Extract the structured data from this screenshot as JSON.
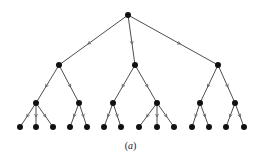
{
  "diagram": {
    "type": "tree",
    "caption": {
      "open": "(",
      "label": "a",
      "close": ")"
    },
    "colors": {
      "edge": "#3a3a3a",
      "node": "#111111",
      "background": "#ffffff"
    },
    "nodes": [
      {
        "id": "r",
        "x": 128,
        "y": 15,
        "level": 0
      },
      {
        "id": "a",
        "x": 59,
        "y": 65,
        "level": 1
      },
      {
        "id": "b",
        "x": 135,
        "y": 65,
        "level": 1
      },
      {
        "id": "c",
        "x": 218,
        "y": 65,
        "level": 1
      },
      {
        "id": "a1",
        "x": 36,
        "y": 103,
        "level": 2
      },
      {
        "id": "a2",
        "x": 79,
        "y": 103,
        "level": 2
      },
      {
        "id": "b1",
        "x": 113,
        "y": 103,
        "level": 2
      },
      {
        "id": "b2",
        "x": 157,
        "y": 103,
        "level": 2
      },
      {
        "id": "c1",
        "x": 200,
        "y": 103,
        "level": 2
      },
      {
        "id": "c2",
        "x": 235,
        "y": 103,
        "level": 2
      },
      {
        "id": "a1x",
        "x": 20,
        "y": 127,
        "level": 3
      },
      {
        "id": "a1y",
        "x": 36,
        "y": 127,
        "level": 3
      },
      {
        "id": "a1z",
        "x": 53,
        "y": 127,
        "level": 3
      },
      {
        "id": "a2x",
        "x": 70,
        "y": 127,
        "level": 3
      },
      {
        "id": "a2y",
        "x": 87,
        "y": 127,
        "level": 3
      },
      {
        "id": "b1x",
        "x": 104,
        "y": 127,
        "level": 3
      },
      {
        "id": "b1y",
        "x": 121,
        "y": 127,
        "level": 3
      },
      {
        "id": "b2x",
        "x": 139,
        "y": 127,
        "level": 3
      },
      {
        "id": "b2y",
        "x": 157,
        "y": 127,
        "level": 3
      },
      {
        "id": "b2z",
        "x": 174,
        "y": 127,
        "level": 3
      },
      {
        "id": "c1x",
        "x": 192,
        "y": 127,
        "level": 3
      },
      {
        "id": "c1y",
        "x": 209,
        "y": 127,
        "level": 3
      },
      {
        "id": "c2x",
        "x": 226,
        "y": 127,
        "level": 3
      },
      {
        "id": "c2y",
        "x": 244,
        "y": 127,
        "level": 3
      }
    ],
    "edges": [
      [
        "r",
        "a"
      ],
      [
        "r",
        "b"
      ],
      [
        "r",
        "c"
      ],
      [
        "a",
        "a1"
      ],
      [
        "a",
        "a2"
      ],
      [
        "b",
        "b1"
      ],
      [
        "b",
        "b2"
      ],
      [
        "c",
        "c1"
      ],
      [
        "c",
        "c2"
      ],
      [
        "a1",
        "a1x"
      ],
      [
        "a1",
        "a1y"
      ],
      [
        "a1",
        "a1z"
      ],
      [
        "a2",
        "a2x"
      ],
      [
        "a2",
        "a2y"
      ],
      [
        "b1",
        "b1x"
      ],
      [
        "b1",
        "b1y"
      ],
      [
        "b2",
        "b2x"
      ],
      [
        "b2",
        "b2y"
      ],
      [
        "b2",
        "b2z"
      ],
      [
        "c1",
        "c1x"
      ],
      [
        "c1",
        "c1y"
      ],
      [
        "c2",
        "c2x"
      ],
      [
        "c2",
        "c2y"
      ]
    ],
    "node_radius": 3,
    "arrow_position": 0.58
  }
}
